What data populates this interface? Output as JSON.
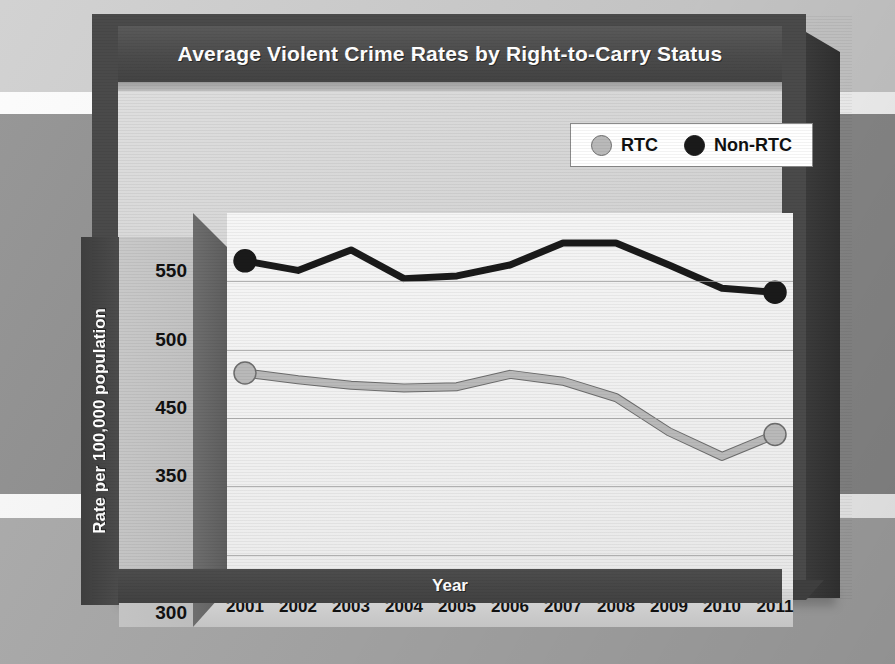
{
  "chart_data": {
    "type": "line",
    "title": "Average Violent Crime Rates by Right-to-Carry Status",
    "xlabel": "Year",
    "ylabel": "Rate per 100,000 population",
    "categories": [
      "2001",
      "2002",
      "2003",
      "2004",
      "2005",
      "2006",
      "2007",
      "2008",
      "2009",
      "2010",
      "2011"
    ],
    "ytick_labels": [
      "550",
      "500",
      "450",
      "350",
      "300"
    ],
    "ytick_values": [
      550,
      500,
      450,
      400,
      300
    ],
    "ylim": [
      300,
      575
    ],
    "grid": true,
    "legend_position": "top-right",
    "series": [
      {
        "name": "RTC",
        "color": "#b9b9b9",
        "marker": "circle",
        "values": [
          458,
          453,
          449,
          447,
          448,
          457,
          452,
          440,
          415,
          397,
          413
        ]
      },
      {
        "name": "Non-RTC",
        "color": "#1a1a1a",
        "marker": "circle",
        "values": [
          540,
          533,
          548,
          527,
          529,
          537,
          553,
          553,
          537,
          520,
          517
        ]
      }
    ]
  },
  "legend": {
    "entries": [
      {
        "label": "RTC",
        "color": "#b9b9b9"
      },
      {
        "label": "Non-RTC",
        "color": "#1a1a1a"
      }
    ]
  },
  "colors": {
    "title_band": "#4b4b4b",
    "shell": "#4a4a4a",
    "panel": "#d4d4d4",
    "plot_area": "#f1f1f1",
    "gridline": "#9b9b9b",
    "rtc_line": "#b9b9b9",
    "nonrtc_line": "#1a1a1a",
    "axis_text": "#111111",
    "banner_text": "#ffffff"
  }
}
